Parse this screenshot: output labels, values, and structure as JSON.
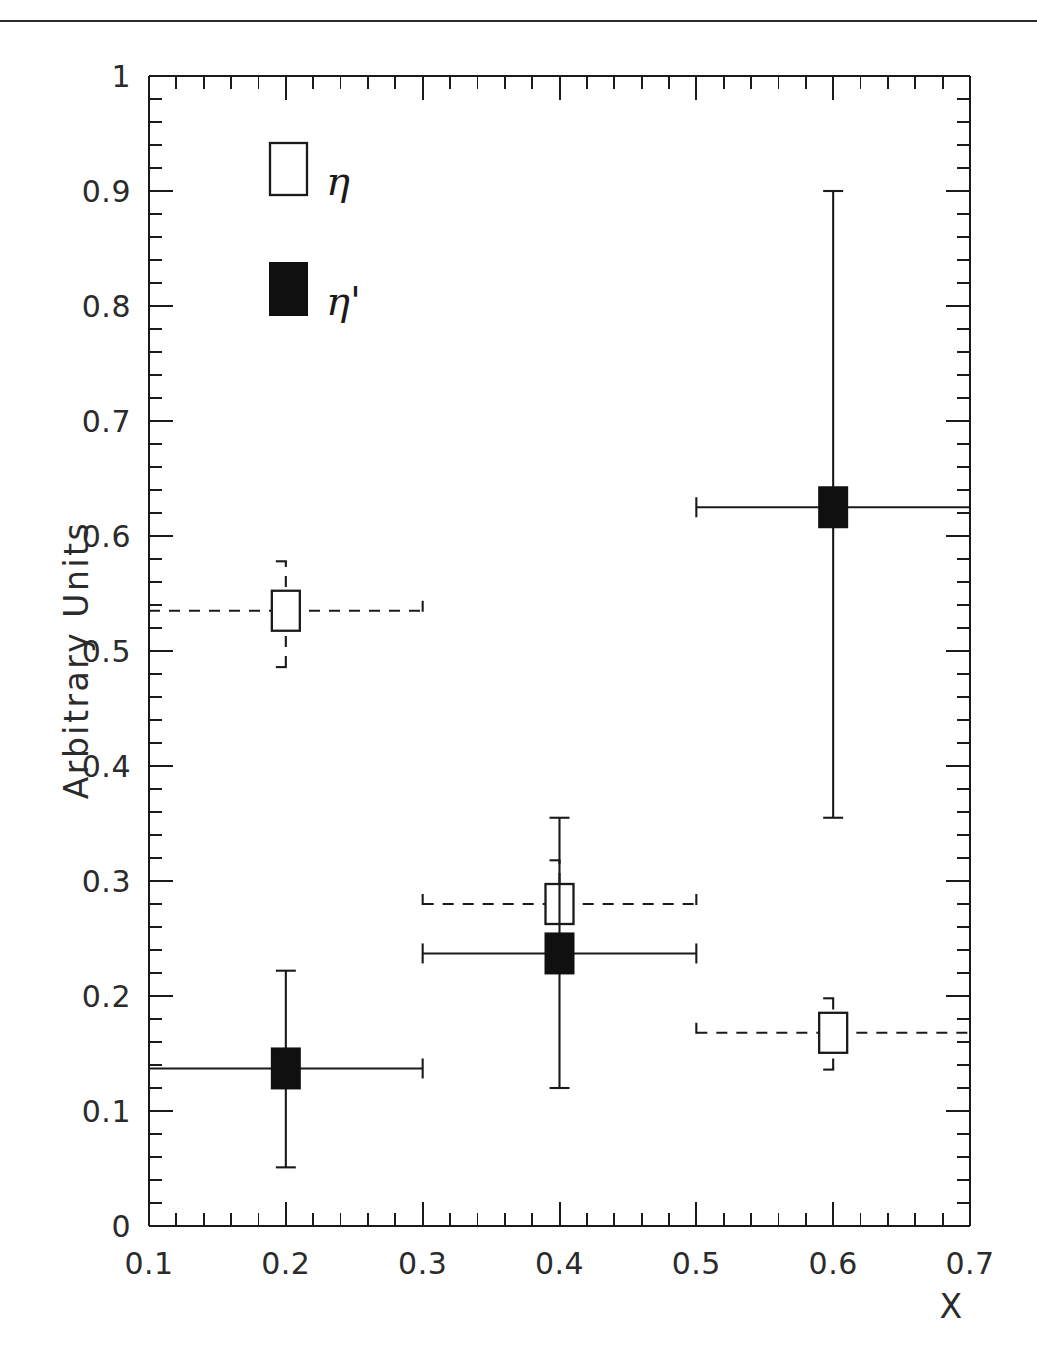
{
  "figure": {
    "background": "#ffffff",
    "ink_color": "#1a1a1a",
    "top_rule": true
  },
  "chart_data": {
    "type": "scatter",
    "title": "",
    "subtitle": "",
    "xlabel": "X",
    "ylabel": "Arbitrary Units",
    "xlim": [
      0.1,
      0.7
    ],
    "ylim": [
      0,
      1
    ],
    "grid": false,
    "legend_position": "upper-left",
    "x_ticks_major": [
      0.1,
      0.2,
      0.3,
      0.4,
      0.5,
      0.6,
      0.7
    ],
    "x_tick_labels": [
      "0.1",
      "0.2",
      "0.3",
      "0.4",
      "0.5",
      "0.6",
      "0.7"
    ],
    "x_minor_per_major": 5,
    "y_ticks_major": [
      0,
      0.1,
      0.2,
      0.3,
      0.4,
      0.5,
      0.6,
      0.7,
      0.8,
      0.9,
      1
    ],
    "y_tick_labels": [
      "0",
      "0.1",
      "0.2",
      "0.3",
      "0.4",
      "0.5",
      "0.6",
      "0.7",
      "0.8",
      "0.9",
      "1"
    ],
    "y_minor_per_major": 5,
    "series": [
      {
        "name": "eta",
        "legend_label": "η",
        "marker": "open-square",
        "linestyle": "dashed",
        "points": [
          {
            "x": 0.2,
            "y": 0.535,
            "yerr_low": 0.049,
            "yerr_high": 0.043,
            "xerr_low": 0.1,
            "xerr_high": 0.1
          },
          {
            "x": 0.4,
            "y": 0.28,
            "yerr_low": 0.0,
            "yerr_high": 0.038,
            "xerr_low": 0.1,
            "xerr_high": 0.1
          },
          {
            "x": 0.6,
            "y": 0.168,
            "yerr_low": 0.032,
            "yerr_high": 0.03,
            "xerr_low": 0.1,
            "xerr_high": 0.1
          }
        ]
      },
      {
        "name": "eta-prime",
        "legend_label": "η'",
        "marker": "filled-square",
        "linestyle": "solid",
        "points": [
          {
            "x": 0.2,
            "y": 0.137,
            "yerr_low": 0.086,
            "yerr_high": 0.085,
            "xerr_low": 0.1,
            "xerr_high": 0.1
          },
          {
            "x": 0.4,
            "y": 0.237,
            "yerr_low": 0.117,
            "yerr_high": 0.118,
            "xerr_low": 0.1,
            "xerr_high": 0.1
          },
          {
            "x": 0.6,
            "y": 0.625,
            "yerr_low": 0.27,
            "yerr_high": 0.275,
            "xerr_low": 0.1,
            "xerr_high": 0.1
          }
        ]
      }
    ],
    "legend_entries": [
      {
        "label": "η",
        "marker": "open-square"
      },
      {
        "label": "η'",
        "marker": "filled-square"
      }
    ]
  }
}
